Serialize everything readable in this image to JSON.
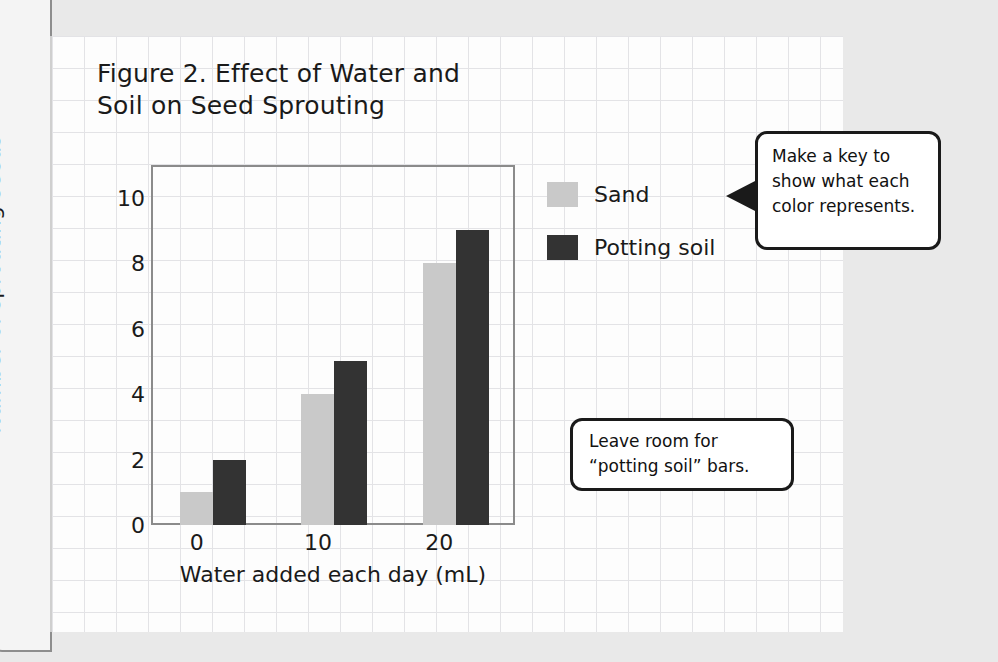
{
  "figure": {
    "title_line1": "Figure 2. Effect of Water and",
    "title_line2": "Soil on Seed Sprouting"
  },
  "legend": {
    "items": [
      {
        "label": "Sand",
        "color": "#c9c9c9"
      },
      {
        "label": "Potting soil",
        "color": "#333333"
      }
    ]
  },
  "callouts": [
    {
      "name": "make-a-key",
      "line1": "Make a key to",
      "line2": "show what each",
      "line3": "color represents."
    },
    {
      "name": "leave-room",
      "line1": "Leave room for",
      "line2": "“potting soil” bars."
    }
  ],
  "chart_data": {
    "type": "bar",
    "title": "Figure 2. Effect of Water and Soil on Seed Sprouting",
    "xlabel": "Water added each day (mL)",
    "ylabel": "Number of sprouting seeds",
    "categories": [
      "0",
      "10",
      "20"
    ],
    "series": [
      {
        "name": "Sand",
        "color": "#c9c9c9",
        "values": [
          1,
          4,
          8
        ]
      },
      {
        "name": "Potting soil",
        "color": "#333333",
        "values": [
          2,
          5,
          9
        ]
      }
    ],
    "ylim": [
      0,
      11
    ],
    "yticks": [
      0,
      2,
      4,
      6,
      8,
      10
    ],
    "ytick_labels": [
      "0",
      "2",
      "4",
      "6",
      "8",
      "10"
    ],
    "xtick_labels": [
      "0",
      "10",
      "20"
    ],
    "grid": false,
    "legend_position": "right"
  }
}
